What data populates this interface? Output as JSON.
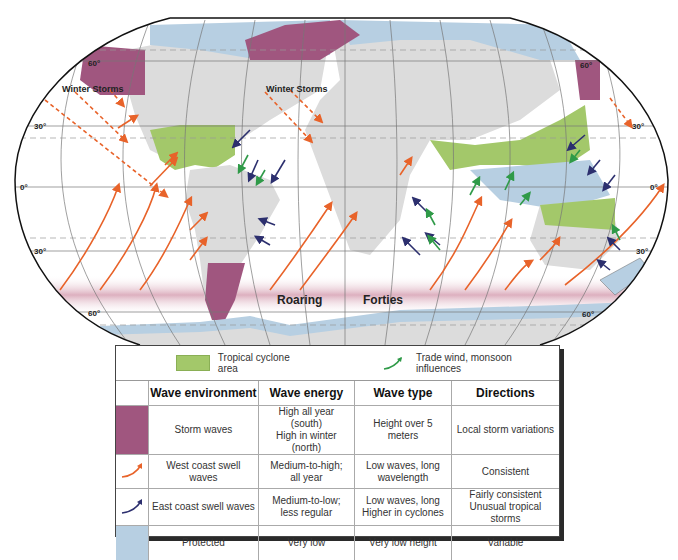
{
  "map": {
    "labels": {
      "winter_storms_west": "Winter Storms",
      "winter_storms_atlantic": "Winter Storms",
      "roaring": "Roaring",
      "forties": "Forties"
    },
    "latitude_labels": {
      "n60_left": "60°",
      "n60_right": "60°",
      "n30_left": "30°",
      "n30_right": "30°",
      "eq_left": "0°",
      "eq_right": "0°",
      "s30_left": "30°",
      "s30_right": "30°",
      "s60_left": "60°",
      "s60_right": "60°"
    },
    "colors": {
      "land": "#dcdcdc",
      "storm_waves": "#a0567f",
      "protected": "#b7cfe2",
      "tropical_cyclone": "#a3c86a",
      "west_swell_arrow": "#e8632a",
      "east_swell_arrow": "#2c2f6e",
      "trade_wind_arrow": "#2f9a48",
      "roaring_forties_band": "#d9a7b8"
    }
  },
  "legend": {
    "tropical_cyclone_label": "Tropical cyclone area",
    "trade_wind_label": "Trade wind, monsoon influences"
  },
  "table": {
    "headers": [
      "",
      "Wave environment",
      "Wave energy",
      "Wave type",
      "Directions"
    ],
    "rows": [
      {
        "swatch": "storm-waves-swatch",
        "environment": "Storm waves",
        "energy": "High all year (south)\nHigh in winter (north)",
        "type": "Height over 5 meters",
        "directions": "Local storm variations"
      },
      {
        "swatch": "west-swell-arrow",
        "environment": "West coast swell waves",
        "energy": "Medium-to-high;\nall year",
        "type": "Low waves, long\nwavelength",
        "directions": "Consistent"
      },
      {
        "swatch": "east-swell-arrow",
        "environment": "East coast swell waves",
        "energy": "Medium-to-low;\nless regular",
        "type": "Low waves, long\nHigher in cyclones",
        "directions": "Fairly consistent\nUnusual tropical storms"
      },
      {
        "swatch": "protected-swatch",
        "environment": "Protected",
        "energy": "Very low",
        "type": "Very low height",
        "directions": "Variable"
      }
    ]
  }
}
